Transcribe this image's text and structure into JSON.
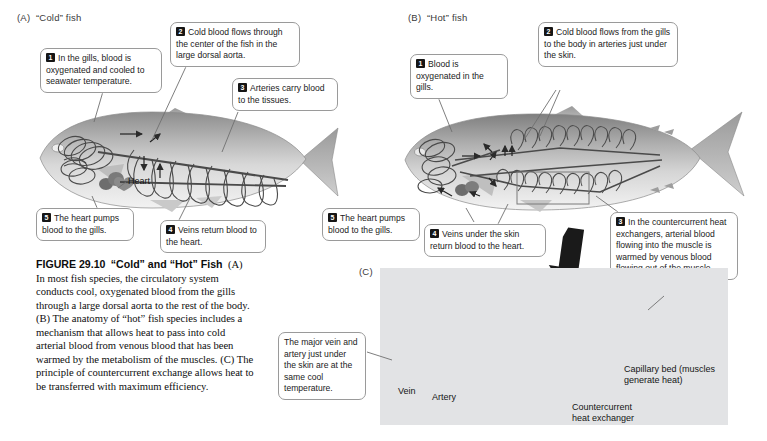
{
  "figure": {
    "number": "FIGURE 29.10",
    "title": "“Cold” and “Hot” Fish",
    "caption_body": "(A) In most fish species, the circulatory system conducts cool, oxygenated blood from the gills through a large dorsal aorta to the rest of the body. (B) The anatomy of “hot” fish species includes a mechanism that allows heat to pass into cold arterial blood from venous blood that has been warmed by the metabolism of the muscles. (C) The principle of countercurrent exchange allows heat to be transferred with maximum efficiency."
  },
  "panels": {
    "a": {
      "letter": "(A)",
      "title": "“Cold” fish",
      "label_heart": "Heart",
      "callouts": [
        {
          "num": "1",
          "text": "In the gills, blood is oxygenated and cooled to seawater temperature."
        },
        {
          "num": "2",
          "text": "Cold blood flows through the center of the fish in the large dorsal aorta."
        },
        {
          "num": "3",
          "text": "Arteries carry blood to the tissues."
        },
        {
          "num": "4",
          "text": "Veins return blood to the heart."
        },
        {
          "num": "5",
          "text": "The heart pumps blood to the gills."
        }
      ]
    },
    "b": {
      "letter": "(B)",
      "title": "“Hot” fish",
      "callouts": [
        {
          "num": "1",
          "text": "Blood is oxygenated in the gills."
        },
        {
          "num": "2",
          "text": "Cold blood flows from the gills to the body in arteries just under the skin."
        },
        {
          "num": "3",
          "text": "In the countercurrent heat exchangers, arterial blood flowing into the muscle is warmed by venous blood flowing out of the muscle."
        },
        {
          "num": "4",
          "text": "Veins under the skin return blood to the heart."
        },
        {
          "num": "5",
          "text": "The heart pumps blood to the gills."
        }
      ]
    },
    "c": {
      "letter": "(C)",
      "callout_skin": "The major vein and artery just under the skin are at the same cool temperature.",
      "labels": {
        "vein": "Vein",
        "artery": "Artery",
        "capillary_bed": "Capillary bed (muscles generate heat)",
        "heat_exchanger": "Countercurrent\nheat exchanger"
      }
    }
  },
  "colors": {
    "panelC_background": "#e2e3e5",
    "callout_border": "#9a9a9a",
    "badge_fill": "#161616",
    "page_background": "#ffffff",
    "vessel_stroke": "#4a4a4a"
  }
}
